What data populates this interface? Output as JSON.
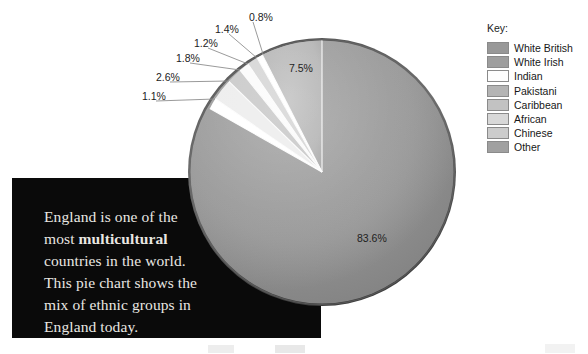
{
  "chart_data": {
    "type": "pie",
    "title": "",
    "categories": [
      "White British",
      "White Irish",
      "Indian",
      "Pakistani",
      "Caribbean",
      "African",
      "Chinese",
      "Other"
    ],
    "values": [
      83.6,
      7.5,
      1.1,
      2.6,
      1.8,
      1.2,
      1.4,
      0.8
    ],
    "value_labels": [
      "83.6%",
      "7.5%",
      "1.1%",
      "2.6%",
      "1.8%",
      "1.2%",
      "1.4%",
      "0.8%"
    ],
    "unit": "percent",
    "legend_position": "right",
    "grid": false,
    "colors": [
      "#989898",
      "#b8b8b8",
      "#ffffff",
      "#bcbcbc",
      "#cfcfcf",
      "#e2e2e2",
      "#dcdcdc",
      "#a8a8a8"
    ],
    "labels_shown_inside": [
      "83.6%",
      "7.5%"
    ],
    "labels_with_leader_lines": [
      "1.1%",
      "2.6%",
      "1.8%",
      "1.2%",
      "1.4%",
      "0.8%"
    ]
  },
  "legend": {
    "title": "Key:",
    "items": [
      {
        "label": "White British",
        "color": "#989898"
      },
      {
        "label": "White Irish",
        "color": "#9e9e9e"
      },
      {
        "label": "Indian",
        "color": "#fdfdfd"
      },
      {
        "label": "Pakistani",
        "color": "#b4b4b4"
      },
      {
        "label": "Caribbean",
        "color": "#c2c2c2"
      },
      {
        "label": "African",
        "color": "#d8d8d8"
      },
      {
        "label": "Chinese",
        "color": "#cccccc"
      },
      {
        "label": "Other",
        "color": "#a0a0a0"
      }
    ]
  },
  "caption": {
    "line_1": "England is one of the",
    "line_2_prefix": "most ",
    "line_2_bold": "multicultural",
    "line_3": "countries in the world.",
    "line_4": "This pie chart shows the",
    "line_5": "mix of ethnic groups in",
    "line_6": "England today."
  },
  "pie_labels": {
    "p_836": "83.6%",
    "p_75": "7.5%",
    "p_11": "1.1%",
    "p_26": "2.6%",
    "p_18": "1.8%",
    "p_12": "1.2%",
    "p_14": "1.4%",
    "p_08": "0.8%"
  },
  "colors": {
    "caption_background": "#0a0a0a",
    "caption_text": "#e9e7e2",
    "page_background": "#ffffff",
    "pie_rim": "#5a5a5a",
    "label_text": "#1b1b1b"
  }
}
